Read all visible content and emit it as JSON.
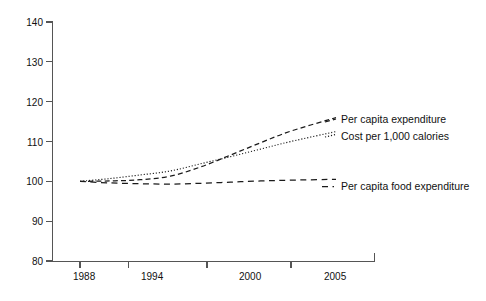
{
  "chart_data": {
    "type": "line",
    "title": "",
    "subtitle": "",
    "xlabel": "",
    "ylabel": "",
    "xlim": [
      1986,
      2007
    ],
    "ylim": [
      80,
      140
    ],
    "grid": false,
    "legend_position": "right-inline",
    "x_tick_labels": [
      "1988",
      "1994",
      "2000",
      "2005"
    ],
    "x_ticks": [
      1988,
      1994,
      2000,
      2005
    ],
    "y_tick_labels": [
      "80",
      "90",
      "100",
      "110",
      "120",
      "130",
      "140"
    ],
    "y_ticks": [
      80,
      90,
      100,
      110,
      120,
      130,
      140
    ],
    "series": [
      {
        "name": "Per capita expenditure",
        "style": "dashed",
        "x": [
          1988,
          1990,
          1992,
          1994,
          1996,
          1998,
          2000,
          2002,
          2005
        ],
        "values": [
          100.0,
          100.1,
          100.4,
          101.3,
          103.6,
          106.6,
          109.7,
          112.6,
          116.0
        ]
      },
      {
        "name": "Cost per 1,000 calories",
        "style": "dotted",
        "x": [
          1988,
          1990,
          1992,
          1994,
          1996,
          1998,
          2000,
          2002,
          2005
        ],
        "values": [
          100.0,
          100.7,
          101.6,
          102.6,
          104.4,
          106.2,
          108.1,
          110.0,
          112.5
        ]
      },
      {
        "name": "Per capita food expenditure",
        "style": "dashed",
        "x": [
          1988,
          1990,
          1992,
          1994,
          1996,
          1998,
          2000,
          2002,
          2005
        ],
        "values": [
          100.0,
          99.6,
          99.4,
          99.3,
          99.5,
          99.8,
          100.1,
          100.3,
          100.5
        ]
      }
    ],
    "annotations": [
      {
        "text": "Per capita expenditure",
        "x": 2005,
        "y": 116.0
      },
      {
        "text": "Cost per 1,000 calories",
        "x": 2005,
        "y": 112.5
      },
      {
        "text": "Per capita food expenditure",
        "x": 2005,
        "y": 100.5
      }
    ],
    "colors": {
      "line": "#1a1a1a",
      "axis": "#555555",
      "text": "#111111",
      "background": "#ffffff"
    }
  },
  "legend": {
    "items": [
      {
        "label": "Per capita expenditure",
        "style": "dashed"
      },
      {
        "label": "Cost per 1,000 calories",
        "style": "dotted"
      },
      {
        "label": "Per capita food expenditure",
        "style": "dashed"
      }
    ]
  }
}
